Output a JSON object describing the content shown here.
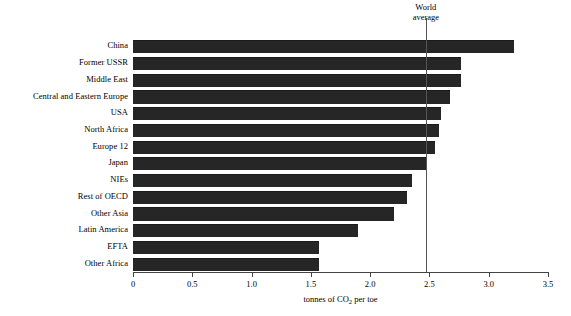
{
  "chart_data": {
    "type": "bar",
    "orientation": "horizontal",
    "title": "",
    "xlabel": "tonnes of CO2 per toe",
    "xlabel_display": "tonnes of CO",
    "xlabel_sub": "2",
    "xlabel_tail": " per toe",
    "ylabel": "",
    "xlim": [
      0,
      3.5
    ],
    "xticks": [
      0,
      0.5,
      1.0,
      1.5,
      2.0,
      2.5,
      3.0,
      3.5
    ],
    "xtick_labels": [
      "0",
      "0.5",
      "1.0",
      "1.5",
      "2.0",
      "2.5",
      "3.0",
      "3.5"
    ],
    "grid": false,
    "legend": false,
    "bar_color": "#262626",
    "categories": [
      "China",
      "Former USSR",
      "Middle East",
      "Central and Eastern Europe",
      "USA",
      "North Africa",
      "Europe 12",
      "Japan",
      "NIEs",
      "Rest of OECD",
      "Other Asia",
      "Latin America",
      "EFTA",
      "Other Africa"
    ],
    "values": [
      3.21,
      2.77,
      2.77,
      2.67,
      2.6,
      2.58,
      2.55,
      2.47,
      2.35,
      2.31,
      2.2,
      1.9,
      1.57,
      1.57
    ],
    "annotations": [
      {
        "name": "world-average",
        "label_line1": "World",
        "label_line2": "average",
        "value": 2.47,
        "type": "vertical-reference-line"
      }
    ]
  }
}
